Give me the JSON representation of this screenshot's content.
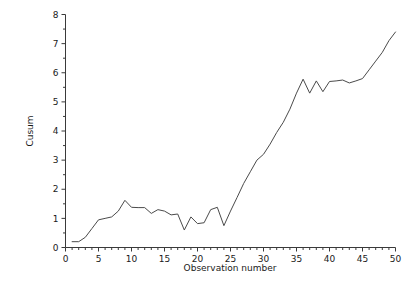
{
  "chart_data": {
    "type": "line",
    "title": "",
    "xlabel": "Observation number",
    "ylabel": "Cusum",
    "xlim": [
      0,
      50
    ],
    "ylim": [
      0,
      8
    ],
    "xticks": [
      0,
      5,
      10,
      15,
      20,
      25,
      30,
      35,
      40,
      45,
      50
    ],
    "yticks": [
      0,
      1,
      2,
      3,
      4,
      5,
      6,
      7,
      8
    ],
    "xtick_labels": [
      "0",
      "5",
      "10",
      "15",
      "20",
      "25",
      "30",
      "35",
      "40",
      "45",
      "50"
    ],
    "ytick_labels": [
      "0",
      "1",
      "2",
      "3",
      "4",
      "5",
      "6",
      "7",
      "8"
    ],
    "x_minor_step": 1,
    "y_minor_step": 0.5,
    "grid": false,
    "legend": false,
    "series": [
      {
        "name": "Cusum",
        "color": "#4a4a4a",
        "x": [
          1,
          2,
          3,
          4,
          5,
          6,
          7,
          8,
          9,
          10,
          11,
          12,
          13,
          14,
          15,
          16,
          17,
          18,
          19,
          20,
          21,
          22,
          23,
          24,
          25,
          26,
          27,
          28,
          29,
          30,
          31,
          32,
          33,
          34,
          35,
          36,
          37,
          38,
          39,
          40,
          41,
          42,
          43,
          44,
          45,
          46,
          47,
          48,
          49,
          50
        ],
        "values": [
          0.2,
          0.2,
          0.35,
          0.65,
          0.95,
          1.0,
          1.05,
          1.25,
          1.62,
          1.38,
          1.37,
          1.37,
          1.17,
          1.3,
          1.25,
          1.12,
          1.15,
          0.6,
          1.05,
          0.82,
          0.85,
          1.3,
          1.38,
          0.75,
          1.25,
          1.72,
          2.2,
          2.6,
          3.0,
          3.2,
          3.55,
          3.95,
          4.3,
          4.75,
          5.3,
          5.78,
          5.3,
          5.72,
          5.35,
          5.7,
          5.72,
          5.75,
          5.65,
          5.72,
          5.8,
          6.1,
          6.4,
          6.7,
          7.1,
          7.4
        ]
      }
    ]
  },
  "footer": {
    "cut_text": ""
  }
}
